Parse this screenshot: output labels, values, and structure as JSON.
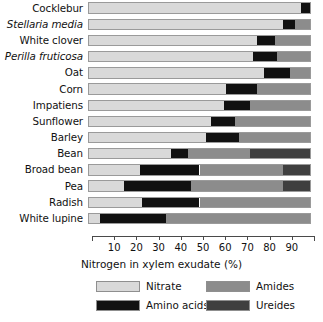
{
  "chart_data": {
    "type": "bar",
    "orientation": "horizontal",
    "stacked": true,
    "title": "",
    "xlabel": "Nitrogen in xylem exudate (%)",
    "ylabel": "",
    "xlim": [
      0,
      100
    ],
    "xticks": [
      10,
      20,
      30,
      40,
      50,
      60,
      70,
      80,
      90
    ],
    "grid": false,
    "legend_position": "bottom",
    "categories": [
      "Cocklebur",
      "Stellaria media",
      "White clover",
      "Perilla fruticosa",
      "Oat",
      "Corn",
      "Impatiens",
      "Sunflower",
      "Barley",
      "Bean",
      "Broad bean",
      "Pea",
      "Radish",
      "White lupine"
    ],
    "series": [
      {
        "name": "Nitrate",
        "color": "#d9d9d9",
        "values": [
          96,
          88,
          76,
          74,
          79,
          62,
          61,
          55,
          53,
          37,
          23,
          16,
          24,
          5
        ]
      },
      {
        "name": "Amino acids",
        "color": "#111111",
        "values": [
          4,
          5,
          8,
          11,
          12,
          14,
          12,
          11,
          15,
          8,
          27,
          30,
          26,
          30
        ]
      },
      {
        "name": "Amides",
        "color": "#8c8c8c",
        "values": [
          0,
          7,
          16,
          15,
          9,
          24,
          27,
          34,
          32,
          28,
          38,
          42,
          50,
          65
        ]
      },
      {
        "name": "Ureides",
        "color": "#3f3f3f",
        "values": [
          0,
          0,
          0,
          0,
          0,
          0,
          0,
          0,
          0,
          27,
          12,
          12,
          0,
          0
        ]
      }
    ]
  },
  "rows": [
    {
      "label": "Cocklebur",
      "italic": false
    },
    {
      "label": "Stellaria media",
      "italic": true
    },
    {
      "label": "White clover",
      "italic": false
    },
    {
      "label": "Perilla fruticosa",
      "italic": true
    },
    {
      "label": "Oat",
      "italic": false
    },
    {
      "label": "Corn",
      "italic": false
    },
    {
      "label": "Impatiens",
      "italic": false
    },
    {
      "label": "Sunflower",
      "italic": false
    },
    {
      "label": "Barley",
      "italic": false
    },
    {
      "label": "Bean",
      "italic": false
    },
    {
      "label": "Broad bean",
      "italic": false
    },
    {
      "label": "Pea",
      "italic": false
    },
    {
      "label": "Radish",
      "italic": false
    },
    {
      "label": "White lupine",
      "italic": false
    }
  ],
  "axis": {
    "title": "Nitrogen in xylem exudate (%)",
    "ticks": [
      "10",
      "20",
      "30",
      "40",
      "50",
      "60",
      "70",
      "80",
      "90"
    ]
  },
  "legend": {
    "entries": [
      {
        "label": "Nitrate",
        "color": "#d9d9d9"
      },
      {
        "label": "Amides",
        "color": "#8c8c8c"
      },
      {
        "label": "Amino acids",
        "color": "#111111"
      },
      {
        "label": "Ureides",
        "color": "#3f3f3f"
      }
    ]
  }
}
